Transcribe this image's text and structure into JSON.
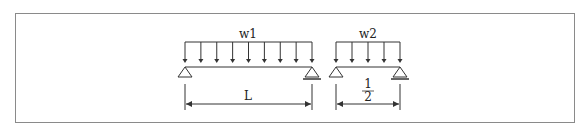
{
  "diagram": {
    "beams": [
      {
        "id": "beam1",
        "load_label": "w1",
        "span_label": "L",
        "x_left": 185,
        "x_right": 312,
        "arrow_count": 9,
        "left_support": "pin",
        "right_support": "roller"
      },
      {
        "id": "beam2",
        "load_label": "w2",
        "span_label_num": "1",
        "span_label_den": "2",
        "x_left": 336,
        "x_right": 400,
        "arrow_count": 5,
        "left_support": "pin",
        "right_support": "roller"
      }
    ],
    "colors": {
      "line": "#333333",
      "frame": "#8a8a8a"
    }
  }
}
